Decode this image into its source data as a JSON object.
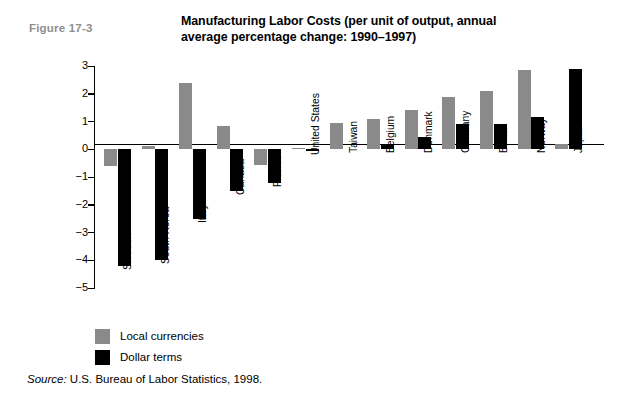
{
  "figure": {
    "number": "Figure 17-3",
    "title": "Manufacturing Labor Costs (per unit of output, annual average percentage change: 1990–1997)",
    "source_word": "Source:",
    "source_text": " U.S. Bureau of Labor Statistics, 1998."
  },
  "legend": {
    "position": "below-plot",
    "items": [
      {
        "label": "Local currencies",
        "color": "#8a8a8a",
        "key": "local"
      },
      {
        "label": "Dollar terms",
        "color": "#000000",
        "key": "dollar"
      }
    ]
  },
  "chart_data": {
    "type": "bar",
    "title": "Manufacturing Labor Costs (per unit of output, annual average percentage change: 1990–1997)",
    "xlabel": "",
    "ylabel": "",
    "ylim": [
      -5,
      3
    ],
    "yticks": [
      3,
      2,
      1,
      0,
      -1,
      -2,
      -3,
      -4,
      -5
    ],
    "ytick_labels": [
      "3",
      "2",
      "1",
      "0",
      "−1",
      "−2",
      "−3",
      "−4",
      "−5"
    ],
    "grid": false,
    "legend_position": "below",
    "categories": [
      "Sweden",
      "South Korea",
      "Italy",
      "Canada",
      "France",
      "United States",
      "Taiwan",
      "Belgium",
      "Denmark",
      "Germany",
      "Britain",
      "Norway",
      "Japan"
    ],
    "series": [
      {
        "name": "Local currencies",
        "color": "#8a8a8a",
        "values": [
          -0.6,
          0.1,
          2.4,
          0.85,
          -0.55,
          0.05,
          0.95,
          1.1,
          1.4,
          1.9,
          2.1,
          2.85,
          0.2
        ]
      },
      {
        "name": "Dollar terms",
        "color": "#000000",
        "values": [
          -4.2,
          -4.0,
          -2.5,
          -1.5,
          -1.2,
          -0.05,
          0.0,
          0.2,
          0.45,
          0.9,
          0.9,
          1.15,
          2.9
        ]
      }
    ]
  }
}
